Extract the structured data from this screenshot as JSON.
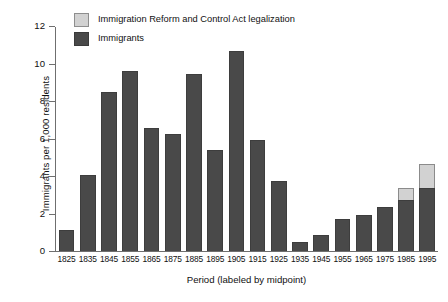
{
  "chart_data": {
    "type": "bar",
    "stacked": true,
    "title": "",
    "xlabel": "Period (labeled by midpoint)",
    "ylabel": "Immigrants per 1,000 residents",
    "ylim": [
      0,
      12
    ],
    "yticks": [
      0,
      2,
      4,
      6,
      8,
      10,
      12
    ],
    "grid": false,
    "legend_position": "top-left-inside",
    "categories": [
      "1825",
      "1835",
      "1845",
      "1855",
      "1865",
      "1875",
      "1885",
      "1895",
      "1905",
      "1915",
      "1925",
      "1935",
      "1945",
      "1955",
      "1965",
      "1975",
      "1985",
      "1995"
    ],
    "series": [
      {
        "name": "Immigrants",
        "color": "#494949",
        "values": [
          1.1,
          4.05,
          8.5,
          9.6,
          6.55,
          6.25,
          9.45,
          5.4,
          10.65,
          5.9,
          3.75,
          0.5,
          0.85,
          1.7,
          1.9,
          2.35,
          2.7,
          3.35
        ]
      },
      {
        "name": "Immigration Reform and Control Act legalization",
        "color": "#d2d2d2",
        "values": [
          0,
          0,
          0,
          0,
          0,
          0,
          0,
          0,
          0,
          0,
          0,
          0,
          0,
          0,
          0,
          0,
          0.65,
          1.3
        ]
      }
    ]
  },
  "legend": {
    "items": [
      {
        "label": "Immigration Reform and Control Act legalization",
        "swatch": "light"
      },
      {
        "label": "Immigrants",
        "swatch": "dark"
      }
    ]
  },
  "colors": {
    "immigrants": "#494949",
    "legalization": "#d2d2d2",
    "axis": "#6f6f6f",
    "background": "#ffffff"
  }
}
